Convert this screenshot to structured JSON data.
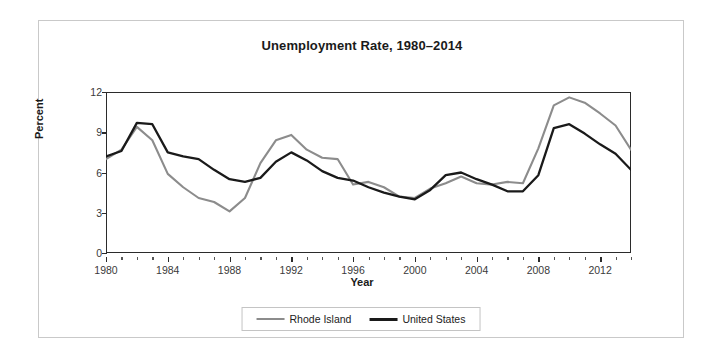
{
  "chart_data": {
    "type": "line",
    "title": "Unemployment Rate, 1980–2014",
    "xlabel": "Year",
    "ylabel": "Percent",
    "xlim": [
      1980,
      2014
    ],
    "ylim": [
      0,
      12
    ],
    "yticks": [
      0,
      3,
      6,
      9,
      12
    ],
    "ytick_labels": [
      "0",
      "3",
      "6",
      "9",
      "12"
    ],
    "xticks": [
      1980,
      1984,
      1988,
      1992,
      1996,
      2000,
      2004,
      2008,
      2012
    ],
    "xtick_labels": [
      "1980",
      "1984",
      "1988",
      "1992",
      "1996",
      "2000",
      "2004",
      "2008",
      "2012"
    ],
    "minor_xtick_interval": 1,
    "grid": "horizontal",
    "legend_position": "bottom-center",
    "x": [
      1980,
      1981,
      1982,
      1983,
      1984,
      1985,
      1986,
      1987,
      1988,
      1989,
      1990,
      1991,
      1992,
      1993,
      1994,
      1995,
      1996,
      1997,
      1998,
      1999,
      2000,
      2001,
      2002,
      2003,
      2004,
      2005,
      2006,
      2007,
      2008,
      2009,
      2010,
      2011,
      2012,
      2013,
      2014
    ],
    "series": [
      {
        "name": "Rhode Island",
        "color": "#8c8c8c",
        "values": [
          7.0,
          7.7,
          9.4,
          8.4,
          5.9,
          4.9,
          4.1,
          3.8,
          3.1,
          4.1,
          6.7,
          8.4,
          8.8,
          7.7,
          7.1,
          7.0,
          5.1,
          5.3,
          4.9,
          4.2,
          4.1,
          4.8,
          5.2,
          5.7,
          5.2,
          5.1,
          5.3,
          5.2,
          7.8,
          11.0,
          11.6,
          11.2,
          10.4,
          9.5,
          7.7
        ]
      },
      {
        "name": "United States",
        "color": "#1a1a1a",
        "values": [
          7.2,
          7.6,
          9.7,
          9.6,
          7.5,
          7.2,
          7.0,
          6.2,
          5.5,
          5.3,
          5.6,
          6.8,
          7.5,
          6.9,
          6.1,
          5.6,
          5.4,
          4.9,
          4.5,
          4.2,
          4.0,
          4.7,
          5.8,
          6.0,
          5.5,
          5.1,
          4.6,
          4.6,
          5.8,
          9.3,
          9.6,
          8.9,
          8.1,
          7.4,
          6.2
        ]
      }
    ]
  },
  "legend": {
    "items": [
      {
        "label": "Rhode Island",
        "color": "#8c8c8c"
      },
      {
        "label": "United States",
        "color": "#1a1a1a"
      }
    ]
  }
}
